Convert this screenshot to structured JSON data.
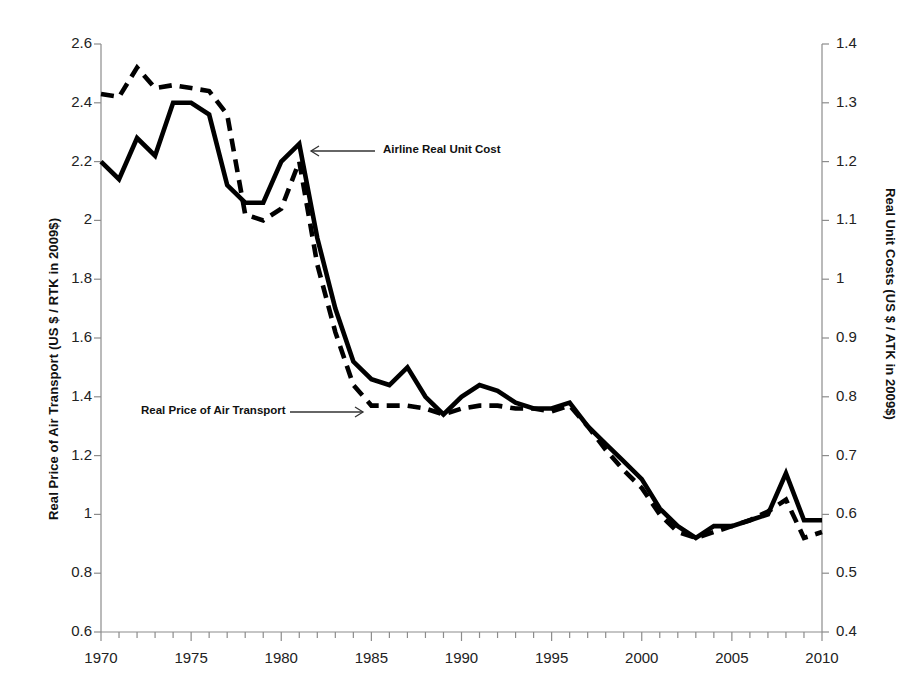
{
  "chart_data": {
    "type": "line",
    "title": "",
    "xlabel": "",
    "ylabel": "Real Price of Air Transport (US $ / RTK in 2009$)",
    "y2label": "Real Unit Costs (US $ / ATK in 2009$)",
    "xlim": [
      1970,
      2010
    ],
    "ylim": [
      0.6,
      2.6
    ],
    "y2lim": [
      0.4,
      1.4
    ],
    "grid": false,
    "legend": "annotations-inline",
    "x_ticks": [
      1970,
      1975,
      1980,
      1985,
      1990,
      1995,
      2000,
      2005,
      2010
    ],
    "x_tick_labels": [
      "1970",
      "1975",
      "1980",
      "1985",
      "1990",
      "1995",
      "2000",
      "2005",
      "2010"
    ],
    "x_minor_tick_step": 1,
    "y_ticks": [
      0.6,
      0.8,
      1,
      1.2,
      1.4,
      1.6,
      1.8,
      2,
      2.2,
      2.4,
      2.6
    ],
    "y_tick_labels": [
      "0.6",
      "0.8",
      "1",
      "1.2",
      "1.4",
      "1.6",
      "1.8",
      "2",
      "2.2",
      "2.4",
      "2.6"
    ],
    "y2_ticks": [
      0.4,
      0.5,
      0.6,
      0.7,
      0.8,
      0.9,
      1,
      1.1,
      1.2,
      1.3,
      1.4
    ],
    "y2_tick_labels": [
      "0.4",
      "0.5",
      "0.6",
      "0.7",
      "0.8",
      "0.9",
      "1",
      "1.1",
      "1.2",
      "1.3",
      "1.4"
    ],
    "x": [
      1970,
      1971,
      1972,
      1973,
      1974,
      1975,
      1976,
      1977,
      1978,
      1979,
      1980,
      1981,
      1982,
      1983,
      1984,
      1985,
      1986,
      1987,
      1988,
      1989,
      1990,
      1991,
      1992,
      1993,
      1994,
      1995,
      1996,
      1997,
      1998,
      1999,
      2000,
      2001,
      2002,
      2003,
      2004,
      2005,
      2006,
      2007,
      2008,
      2009,
      2010
    ],
    "series": [
      {
        "name": "Airline Real Unit Cost",
        "axis": "right",
        "style": "solid",
        "color": "#000000",
        "values_left_scale": [
          2.2,
          2.13,
          2.28,
          2.22,
          2.4,
          2.39,
          2.36,
          2.12,
          2.06,
          2.06,
          2.19,
          2.26,
          1.94,
          1.7,
          1.52,
          1.45,
          1.44,
          1.49,
          1.4,
          1.34,
          1.39,
          1.43,
          1.41,
          1.38,
          1.36,
          1.36,
          1.37,
          1.3,
          1.23,
          1.17,
          1.11,
          1.02,
          0.96,
          0.92,
          0.95,
          0.96,
          0.98,
          1.0,
          1.13,
          0.97,
          0.97
        ],
        "values": [
          1.2,
          1.17,
          1.24,
          1.21,
          1.3,
          1.3,
          1.28,
          1.16,
          1.13,
          1.13,
          1.2,
          1.23,
          1.07,
          0.95,
          0.86,
          0.83,
          0.82,
          0.85,
          0.8,
          0.77,
          0.8,
          0.82,
          0.81,
          0.79,
          0.78,
          0.78,
          0.79,
          0.75,
          0.72,
          0.69,
          0.66,
          0.61,
          0.58,
          0.56,
          0.58,
          0.58,
          0.59,
          0.6,
          0.67,
          0.59,
          0.59
        ]
      },
      {
        "name": "Real Price of Air Transport",
        "axis": "left",
        "style": "dashed",
        "color": "#000000",
        "values": [
          2.43,
          2.42,
          2.52,
          2.45,
          2.46,
          2.45,
          2.44,
          2.36,
          2.02,
          2.0,
          2.04,
          2.2,
          1.85,
          1.62,
          1.44,
          1.37,
          1.37,
          1.37,
          1.36,
          1.34,
          1.36,
          1.37,
          1.37,
          1.36,
          1.36,
          1.35,
          1.37,
          1.3,
          1.22,
          1.15,
          1.09,
          1.0,
          0.94,
          0.92,
          0.94,
          0.96,
          0.98,
          1.01,
          1.05,
          0.92,
          0.94
        ]
      }
    ],
    "annotations": [
      {
        "id": "airline-real-unit-cost",
        "text": "Airline Real Unit Cost",
        "arrow": "left",
        "points_at_year": 1981
      },
      {
        "id": "real-price-of-air-transport",
        "text": "Real Price of Air Transport",
        "arrow": "right",
        "points_at_year": 1985
      }
    ]
  }
}
